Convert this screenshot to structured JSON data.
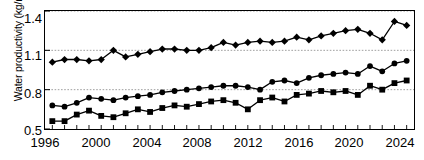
{
  "chart_data": {
    "type": "line",
    "title": "",
    "xlabel": "",
    "ylabel": "Water productivity (kg/m³)",
    "xlim": [
      1995.4,
      2025.6
    ],
    "ylim": [
      0.5,
      1.4
    ],
    "grid": true,
    "legend": "none",
    "y_ticks": [
      "0.5",
      "0.8",
      "1.1",
      "1.4"
    ],
    "y_tick_values": [
      0.5,
      0.8,
      1.1,
      1.4
    ],
    "x_ticks": [
      "1996",
      "2000",
      "2004",
      "2008",
      "2012",
      "2016",
      "2020",
      "2024"
    ],
    "x_tick_values": [
      1996,
      2000,
      2004,
      2008,
      2012,
      2016,
      2020,
      2024
    ],
    "x_minor_tick_values": [
      1996,
      1997,
      1998,
      1999,
      2000,
      2001,
      2002,
      2003,
      2004,
      2005,
      2006,
      2007,
      2008,
      2009,
      2010,
      2011,
      2012,
      2013,
      2014,
      2015,
      2016,
      2017,
      2018,
      2019,
      2020,
      2021,
      2022,
      2023,
      2024,
      2025
    ],
    "x": [
      1996,
      1997,
      1998,
      1999,
      2000,
      2001,
      2002,
      2003,
      2004,
      2005,
      2006,
      2007,
      2008,
      2009,
      2010,
      2011,
      2012,
      2013,
      2014,
      2015,
      2016,
      2017,
      2018,
      2019,
      2020,
      2021,
      2022,
      2023,
      2024,
      2025
    ],
    "series": [
      {
        "name": "series-diamond",
        "marker": "diamond",
        "color": "#000000",
        "values": [
          1.01,
          1.03,
          1.03,
          1.02,
          1.03,
          1.1,
          1.05,
          1.07,
          1.09,
          1.11,
          1.11,
          1.1,
          1.1,
          1.12,
          1.16,
          1.14,
          1.16,
          1.17,
          1.16,
          1.17,
          1.2,
          1.18,
          1.21,
          1.23,
          1.25,
          1.26,
          1.23,
          1.18,
          1.32,
          1.29
        ]
      },
      {
        "name": "series-circle",
        "marker": "circle",
        "color": "#000000",
        "values": [
          0.68,
          0.67,
          0.7,
          0.74,
          0.73,
          0.72,
          0.74,
          0.75,
          0.76,
          0.78,
          0.79,
          0.8,
          0.81,
          0.82,
          0.83,
          0.83,
          0.82,
          0.8,
          0.86,
          0.87,
          0.85,
          0.89,
          0.91,
          0.92,
          0.93,
          0.92,
          0.98,
          0.94,
          1.0,
          1.02
        ]
      },
      {
        "name": "series-square",
        "marker": "square",
        "color": "#000000",
        "values": [
          0.56,
          0.56,
          0.61,
          0.64,
          0.6,
          0.59,
          0.62,
          0.65,
          0.63,
          0.66,
          0.68,
          0.67,
          0.69,
          0.71,
          0.72,
          0.7,
          0.65,
          0.72,
          0.74,
          0.71,
          0.76,
          0.77,
          0.79,
          0.78,
          0.79,
          0.76,
          0.83,
          0.8,
          0.85,
          0.87
        ]
      }
    ]
  }
}
